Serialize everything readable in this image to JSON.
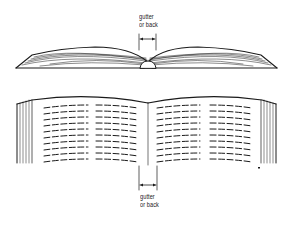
{
  "diagram": {
    "top_view": {
      "label_line1": "gutter",
      "label_line2": "or back",
      "description": "end view of open book showing curved page stacks meeting at the spine"
    },
    "bottom_view": {
      "label_line1": "gutter",
      "label_line2": "or back",
      "description": "perspective view of open book with two pages of text (dashed lines) in two columns each"
    },
    "colors": {
      "ink": "#1a1a1a",
      "background": "#ffffff"
    }
  }
}
